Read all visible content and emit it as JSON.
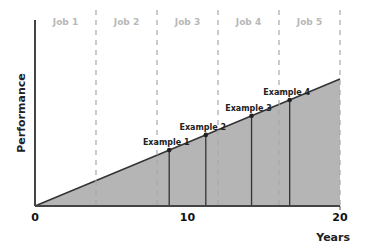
{
  "chart_data": {
    "type": "area",
    "title": "",
    "xlabel": "Years",
    "ylabel": "Performance",
    "xlim": [
      0,
      20
    ],
    "x_ticks": [
      0,
      10,
      20
    ],
    "x_tick_labels": [
      "0",
      "10",
      "20"
    ],
    "line": {
      "x": [
        0,
        20
      ],
      "y": [
        0,
        100
      ]
    },
    "job_boundaries": [
      4,
      8,
      12,
      16,
      20
    ],
    "jobs": [
      {
        "label": "Job 1",
        "x_start": 0,
        "x_end": 4
      },
      {
        "label": "Job 2",
        "x_start": 4,
        "x_end": 8
      },
      {
        "label": "Job 3",
        "x_start": 8,
        "x_end": 12
      },
      {
        "label": "Job 4",
        "x_start": 12,
        "x_end": 16
      },
      {
        "label": "Job 5",
        "x_start": 16,
        "x_end": 20
      }
    ],
    "examples": [
      {
        "label": "Example 1",
        "x": 8.8
      },
      {
        "label": "Example 2",
        "x": 11.2
      },
      {
        "label": "Example 3",
        "x": 14.2
      },
      {
        "label": "Example 4",
        "x": 16.7
      }
    ],
    "grid": false,
    "legend": null
  },
  "colors": {
    "fill": "#b5b5b5",
    "line": "#333333",
    "dashed": "#a8a8a8",
    "axis": "#444444",
    "job_text": "#b8b8b8"
  }
}
